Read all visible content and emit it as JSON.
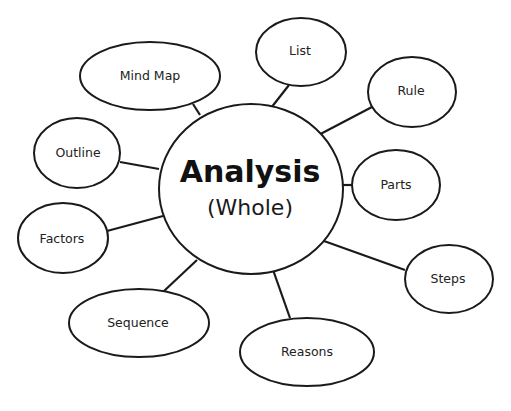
{
  "diagram": {
    "type": "mind-map",
    "colors": {
      "stroke": "#1a1a1a",
      "fill": "#ffffff",
      "text": "#222222"
    },
    "center": {
      "title": "Analysis",
      "subtitle": "(Whole)"
    },
    "nodes": [
      {
        "id": "mind-map",
        "label": "Mind Map"
      },
      {
        "id": "list",
        "label": "List"
      },
      {
        "id": "rule",
        "label": "Rule"
      },
      {
        "id": "outline",
        "label": "Outline"
      },
      {
        "id": "parts",
        "label": "Parts"
      },
      {
        "id": "factors",
        "label": "Factors"
      },
      {
        "id": "steps",
        "label": "Steps"
      },
      {
        "id": "sequence",
        "label": "Sequence"
      },
      {
        "id": "reasons",
        "label": "Reasons"
      }
    ]
  }
}
